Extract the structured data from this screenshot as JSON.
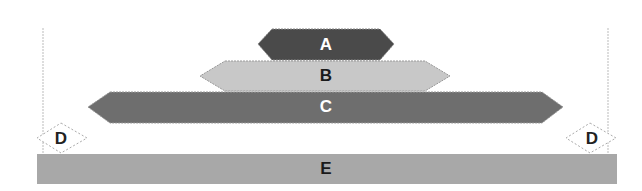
{
  "diagram": {
    "type": "stacked-hexagon-levels",
    "levels": [
      {
        "id": "A",
        "label": "A",
        "fill": "#4a4a4a",
        "text_color": "#ffffff"
      },
      {
        "id": "B",
        "label": "B",
        "fill": "#c8c8c8",
        "text_color": "#1a1a1a"
      },
      {
        "id": "C",
        "label": "C",
        "fill": "#6e6e6e",
        "text_color": "#ffffff"
      },
      {
        "id": "D",
        "label": "D",
        "fill": "#ffffff",
        "text_color": "#222222"
      },
      {
        "id": "E",
        "label": "E",
        "fill": "#a8a8a8",
        "text_color": "#1a1a1a"
      }
    ],
    "side_labels": {
      "left": "D",
      "right": "D"
    }
  }
}
